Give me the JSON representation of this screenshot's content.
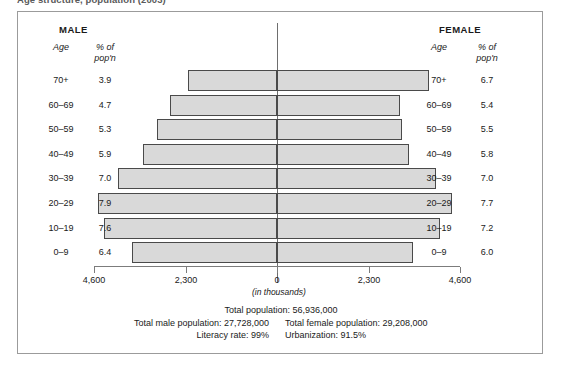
{
  "chart_title_fragment": "Age structure, population (2003)",
  "headings": {
    "male": "MALE",
    "female": "FEMALE",
    "age_label": "Age",
    "pct_label_line1": "% of",
    "pct_label_line2": "pop'n"
  },
  "axis": {
    "unit_label": "(in thousands)",
    "tick_labels": [
      "4,600",
      "2,300",
      "0",
      "2,300",
      "4,600"
    ],
    "tick_values": [
      -4600,
      -2300,
      0,
      2300,
      4600
    ]
  },
  "footer": {
    "total_population": "Total population: 56,936,000",
    "total_male_population": "Total male population: 27,728,000",
    "total_female_population": "Total female population: 29,208,000",
    "literacy_rate": "Literacy rate: 99%",
    "urbanization": "Urbanization: 91.5%"
  },
  "colors": {
    "bar_fill": "#d9d9d9",
    "bar_stroke": "#4a4a4a",
    "frame": "#9b9b9b",
    "axis": "#7c7c7c"
  },
  "chart_data": {
    "type": "bar",
    "subtype": "population-pyramid",
    "title": "Age structure, population (2003)",
    "xlabel": "(in thousands)",
    "ylabel": "Age",
    "orientation": "horizontal",
    "grid": false,
    "legend": "none",
    "xlim": [
      -4600,
      4600
    ],
    "xticks": [
      -4600,
      -2300,
      0,
      2300,
      4600
    ],
    "xticklabels": [
      "4,600",
      "2,300",
      "0",
      "2,300",
      "4,600"
    ],
    "categories": [
      "70+",
      "60–69",
      "50–59",
      "40–49",
      "30–39",
      "20–29",
      "10–19",
      "0–9"
    ],
    "series": [
      {
        "name": "MALE",
        "unit": "% of pop'n",
        "side": "left",
        "values": [
          3.9,
          4.7,
          5.3,
          5.9,
          7.0,
          7.9,
          7.6,
          6.4
        ]
      },
      {
        "name": "FEMALE",
        "unit": "% of pop'n",
        "side": "right",
        "values": [
          6.7,
          5.4,
          5.5,
          5.8,
          7.0,
          7.7,
          7.2,
          6.0
        ]
      }
    ],
    "annotations": [
      "Total population: 56,936,000",
      "Total male population: 27,728,000",
      "Total female population: 29,208,000",
      "Literacy rate: 99%",
      "Urbanization: 91.5%"
    ]
  },
  "rows": [
    {
      "age": "70+",
      "male_pct": "3.9",
      "female_pct": "6.7"
    },
    {
      "age": "60–69",
      "male_pct": "4.7",
      "female_pct": "5.4"
    },
    {
      "age": "50–59",
      "male_pct": "5.3",
      "female_pct": "5.5"
    },
    {
      "age": "40–49",
      "male_pct": "5.9",
      "female_pct": "5.8"
    },
    {
      "age": "30–39",
      "male_pct": "7.0",
      "female_pct": "7.0"
    },
    {
      "age": "20–29",
      "male_pct": "7.9",
      "female_pct": "7.7"
    },
    {
      "age": "10–19",
      "male_pct": "7.6",
      "female_pct": "7.2"
    },
    {
      "age": "0–9",
      "male_pct": "6.4",
      "female_pct": "6.0"
    }
  ]
}
